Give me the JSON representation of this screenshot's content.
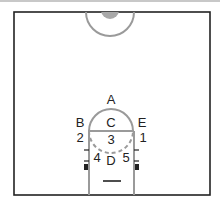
{
  "diagram": {
    "type": "basketball-half-court",
    "labels": {
      "A": "A",
      "B": "B",
      "C": "C",
      "D": "D",
      "E": "E",
      "n1": "1",
      "n2": "2",
      "n3": "3",
      "n4": "4",
      "n5": "5"
    },
    "colors": {
      "line": "#222222",
      "hatched_line": "#9a9a9a",
      "center_fill": "#a8a8a8",
      "background": "#ffffff"
    }
  }
}
